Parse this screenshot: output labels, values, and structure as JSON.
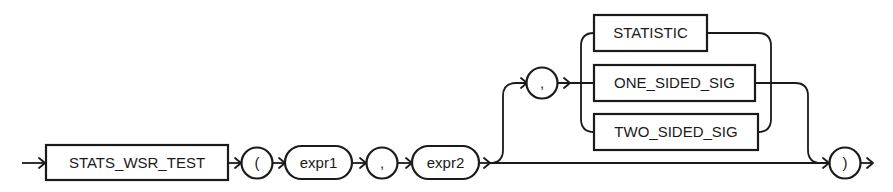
{
  "diagram": {
    "type": "syntax-railroad",
    "function_keyword": "STATS_WSR_TEST",
    "open_paren": "(",
    "arg1": "expr1",
    "comma1": ",",
    "arg2": "expr2",
    "comma2": ",",
    "options": [
      "STATISTIC",
      "ONE_SIDED_SIG",
      "TWO_SIDED_SIG"
    ],
    "close_paren": ")"
  },
  "colors": {
    "stroke": "#1a1a1a",
    "background": "#ffffff"
  }
}
